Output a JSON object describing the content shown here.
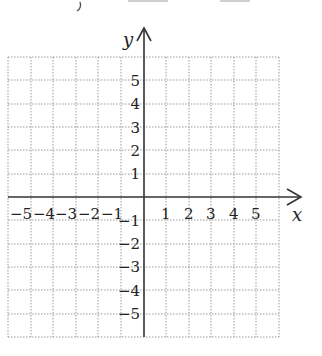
{
  "diagram": {
    "type": "coordinate-plane",
    "x_axis": {
      "label": "x",
      "min": -6,
      "max": 6,
      "tick_labels": [
        "-5",
        "-4",
        "-3",
        "-2",
        "-1",
        "1",
        "2",
        "3",
        "4",
        "5"
      ]
    },
    "y_axis": {
      "label": "y",
      "min": -6,
      "max": 6,
      "tick_labels": [
        "5",
        "4",
        "3",
        "2",
        "1",
        "-1",
        "-2",
        "-3",
        "-4",
        "-5"
      ]
    },
    "grid": {
      "style": "dotted",
      "columns": 12,
      "rows": 12,
      "color": "#9a9a9a"
    },
    "axis_color": "#333333"
  },
  "labels": {
    "x": "x",
    "y": "y",
    "xneg5": "−5",
    "xneg4": "−4",
    "xneg3": "−3",
    "xneg2": "−2",
    "xneg1": "−1",
    "x1": "1",
    "x2": "2",
    "x3": "3",
    "x4": "4",
    "x5": "5",
    "y5": "5",
    "y4": "4",
    "y3": "3",
    "y2": "2",
    "y1": "1",
    "yneg1": "−1",
    "yneg2": "−2",
    "yneg3": "−3",
    "yneg4": "−4",
    "yneg5": "−5"
  }
}
